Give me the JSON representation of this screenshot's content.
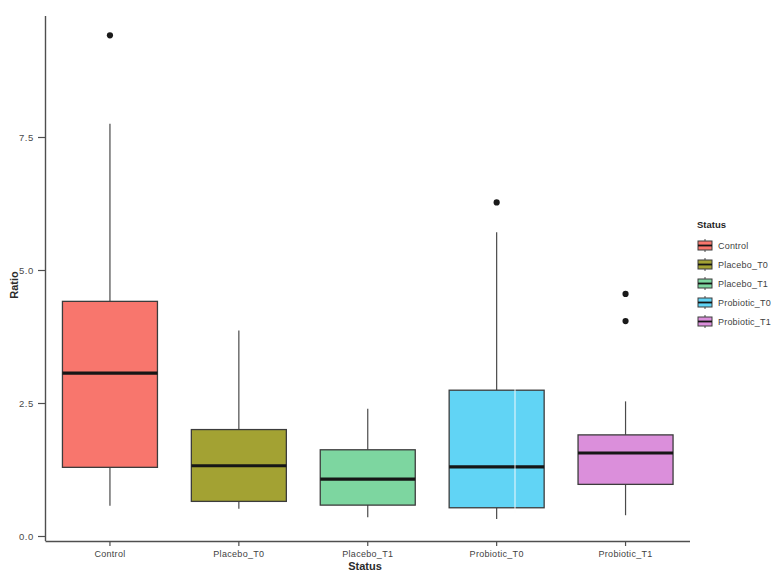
{
  "chart_data": {
    "type": "box",
    "title": "",
    "xlabel": "Status",
    "ylabel": "Ratio",
    "categories": [
      "Control",
      "Placebo_T0",
      "Placebo_T1",
      "Probiotic_T0",
      "Probiotic_T1"
    ],
    "ylim": [
      0.0,
      9.9
    ],
    "yticks": [
      0.0,
      2.5,
      5.0,
      7.5
    ],
    "ytick_labels": [
      "0.0",
      "2.5",
      "5.0",
      "7.5"
    ],
    "grid": false,
    "legend_position": "right",
    "legend_title": "Status",
    "series": [
      {
        "name": "Control",
        "color": "#F8766D",
        "q1": 1.3,
        "median": 3.07,
        "q3": 4.42,
        "whisker_low": 0.58,
        "whisker_high": 7.76,
        "outliers": [
          9.42
        ]
      },
      {
        "name": "Placebo_T0",
        "color": "#A3A233",
        "q1": 0.66,
        "median": 1.33,
        "q3": 2.01,
        "whisker_low": 0.52,
        "whisker_high": 3.87,
        "outliers": []
      },
      {
        "name": "Placebo_T1",
        "color": "#7DD6A0",
        "q1": 0.59,
        "median": 1.08,
        "q3": 1.63,
        "whisker_low": 0.36,
        "whisker_high": 2.4,
        "outliers": []
      },
      {
        "name": "Probiotic_T0",
        "color": "#61D4F5",
        "q1": 0.54,
        "median": 1.31,
        "q3": 2.75,
        "whisker_low": 0.33,
        "whisker_high": 5.72,
        "outliers": [
          6.28
        ]
      },
      {
        "name": "Probiotic_T1",
        "color": "#DB8FDB",
        "q1": 0.98,
        "median": 1.57,
        "q3": 1.91,
        "whisker_low": 0.4,
        "whisker_high": 2.54,
        "outliers": [
          4.56,
          4.05
        ]
      }
    ]
  },
  "axes": {
    "y_title": "Ratio",
    "x_title": "Status",
    "y_tick_0": "0.0",
    "y_tick_1": "2.5",
    "y_tick_2": "5.0",
    "y_tick_3": "7.5",
    "x_cat_0": "Control",
    "x_cat_1": "Placebo_T0",
    "x_cat_2": "Placebo_T1",
    "x_cat_3": "Probiotic_T0",
    "x_cat_4": "Probiotic_T1"
  },
  "legend": {
    "title": "Status",
    "items": [
      {
        "label": "Control",
        "color": "#F8766D"
      },
      {
        "label": "Placebo_T0",
        "color": "#A3A233"
      },
      {
        "label": "Placebo_T1",
        "color": "#7DD6A0"
      },
      {
        "label": "Probiotic_T0",
        "color": "#61D4F5"
      },
      {
        "label": "Probiotic_T1",
        "color": "#DB8FDB"
      }
    ]
  }
}
